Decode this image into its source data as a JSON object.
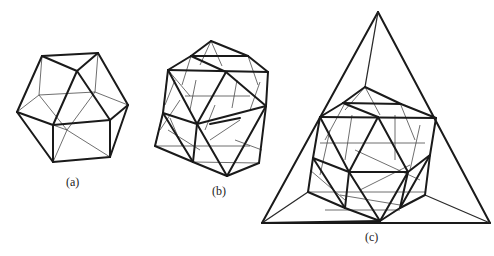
{
  "figure": {
    "panels": [
      {
        "id": "a",
        "label": "(a)",
        "description": "wireframe polyhedron (cuboctahedral/icosahedral frame)"
      },
      {
        "id": "b",
        "label": "(b)",
        "description": "subdivided wireframe polyhedron with triangulated faces"
      },
      {
        "id": "c",
        "label": "(c)",
        "description": "subdivided polyhedron inscribed in a tetrahedral frame"
      }
    ],
    "colors": {
      "line": "#1a1a1a",
      "background": "#ffffff"
    }
  }
}
